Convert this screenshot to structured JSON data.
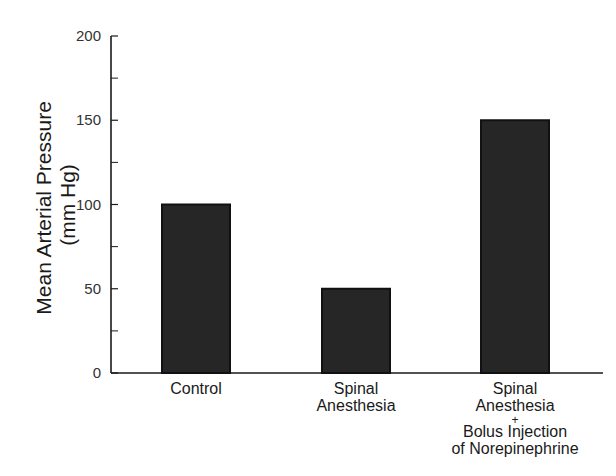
{
  "chart_data": {
    "type": "bar",
    "title": "",
    "xlabel": "",
    "ylabel": "Mean Arterial Pressure",
    "ylabel_unit": "(mm Hg)",
    "ylim": [
      0,
      200
    ],
    "yticks_major": [
      0,
      50,
      100,
      150,
      200
    ],
    "yticks_minor": [
      25,
      75,
      125,
      175
    ],
    "grid": false,
    "legend": null,
    "categories": [
      "Control",
      "Spinal Anesthesia",
      "Spinal Anesthesia + Bolus Injection of Norepinephrine"
    ],
    "category_label_lines": [
      [
        "Control"
      ],
      [
        "Spinal",
        "Anesthesia"
      ],
      [
        "Spinal",
        "Anesthesia",
        "+",
        "Bolus Injection",
        "of Norepinephrine"
      ]
    ],
    "values": [
      100,
      50,
      150
    ],
    "colors": {
      "bar_fill": "#262626",
      "bar_edge": "#111111",
      "axis": "#1a1a1a"
    }
  }
}
